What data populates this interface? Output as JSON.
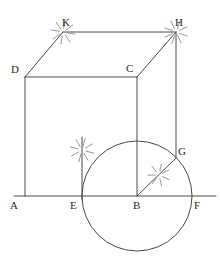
{
  "figure": {
    "stroke_color": "#4a4a4a",
    "construction_color": "#8a8a8a",
    "label_color": "#2b2b2b",
    "background_color": "#ffffff",
    "width": 220,
    "height": 262
  },
  "points": {
    "A": {
      "label": "A",
      "x": 25,
      "y": 196,
      "label_x": 10,
      "label_y": 209
    },
    "B": {
      "label": "B",
      "x": 137,
      "y": 196,
      "label_x": 133,
      "label_y": 209
    },
    "C": {
      "label": "C",
      "x": 137,
      "y": 77,
      "label_x": 126,
      "label_y": 72
    },
    "D": {
      "label": "D",
      "x": 25,
      "y": 77,
      "label_x": 11,
      "label_y": 73
    },
    "E": {
      "label": "E",
      "x": 82,
      "y": 196,
      "label_x": 70,
      "label_y": 209
    },
    "F": {
      "label": "F",
      "x": 192,
      "y": 196,
      "label_x": 194,
      "label_y": 209
    },
    "G": {
      "label": "G",
      "x": 176,
      "y": 158,
      "label_x": 178,
      "label_y": 155
    },
    "H": {
      "label": "H",
      "x": 176,
      "y": 32,
      "label_x": 175,
      "label_y": 26
    },
    "K": {
      "label": "K",
      "x": 63,
      "y": 32,
      "label_x": 62,
      "label_y": 26
    }
  },
  "segments": [
    {
      "name": "segment-A-D",
      "from": "A",
      "to": "D"
    },
    {
      "name": "segment-D-C",
      "from": "D",
      "to": "C"
    },
    {
      "name": "segment-C-B",
      "from": "C",
      "to": "B"
    },
    {
      "name": "segment-D-K",
      "from": "D",
      "to": "K"
    },
    {
      "name": "segment-K-H",
      "from": "K",
      "to": "H"
    },
    {
      "name": "segment-C-H",
      "from": "C",
      "to": "H"
    },
    {
      "name": "segment-H-G",
      "from": "H",
      "to": "G"
    },
    {
      "name": "segment-B-G",
      "from": "B",
      "to": "G"
    }
  ],
  "baseline": {
    "name": "baseline-A-F",
    "x1": 14,
    "y1": 196,
    "x2": 216,
    "y2": 196
  },
  "perpendicular_at_E": {
    "name": "perpendicular-line-at-E",
    "x1": 82,
    "y1": 137,
    "x2": 82,
    "y2": 200
  },
  "circle": {
    "name": "circle-centered-at-B",
    "cx": 137,
    "cy": 196,
    "r": 55
  },
  "compass_marks": [
    {
      "name": "compass-marks-at-K",
      "cx": 63,
      "cy": 32,
      "inner": 4,
      "outer": 12,
      "count": 8,
      "start_deg": 10
    },
    {
      "name": "compass-marks-at-H",
      "cx": 176,
      "cy": 32,
      "inner": 4,
      "outer": 12,
      "count": 8,
      "start_deg": 20
    },
    {
      "name": "compass-marks-at-E",
      "cx": 82,
      "cy": 150,
      "inner": 4,
      "outer": 12,
      "count": 8,
      "start_deg": 15
    },
    {
      "name": "compass-marks-at-BG-midpoint",
      "cx": 159,
      "cy": 175,
      "inner": 4,
      "outer": 11,
      "count": 7,
      "start_deg": 25
    }
  ]
}
